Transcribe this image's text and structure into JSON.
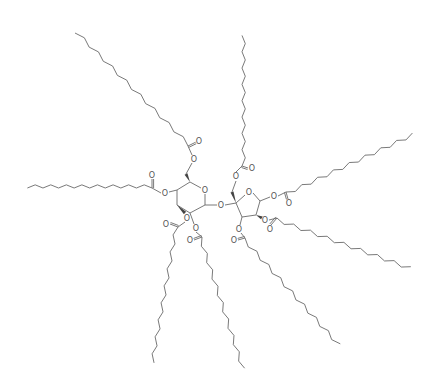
{
  "figure": {
    "type": "chemical-structure",
    "colors": {
      "bond": "#6a6a6a",
      "label": "#555555",
      "background": "#ffffff"
    }
  },
  "atoms": {
    "oxygen_label": "O"
  },
  "rings": [
    {
      "name": "glucopyranose",
      "ring_oxygen": "O"
    },
    {
      "name": "fructofuranose",
      "ring_oxygen": "O"
    }
  ],
  "glycosidic_link": {
    "label": "O"
  },
  "ester_chains": [
    {
      "name": "chain-glc-c6",
      "ester_o": "O",
      "carbonyl_o": "O",
      "chain_carbons": 16
    },
    {
      "name": "chain-glc-c4",
      "ester_o": "O",
      "carbonyl_o": "O",
      "chain_carbons": 16
    },
    {
      "name": "chain-glc-c3",
      "ester_o": "O",
      "carbonyl_o": "O",
      "chain_carbons": 16
    },
    {
      "name": "chain-glc-c2",
      "ester_o": "O",
      "carbonyl_o": "O",
      "chain_carbons": 16
    },
    {
      "name": "chain-fru-c1",
      "ester_o": "O",
      "carbonyl_o": "O",
      "chain_carbons": 16
    },
    {
      "name": "chain-fru-c6",
      "ester_o": "O",
      "carbonyl_o": "O",
      "chain_carbons": 16
    },
    {
      "name": "chain-fru-c4",
      "ester_o": "O",
      "carbonyl_o": "O",
      "chain_carbons": 16
    },
    {
      "name": "chain-fru-c3",
      "ester_o": "O",
      "carbonyl_o": "O",
      "chain_carbons": 16
    }
  ]
}
